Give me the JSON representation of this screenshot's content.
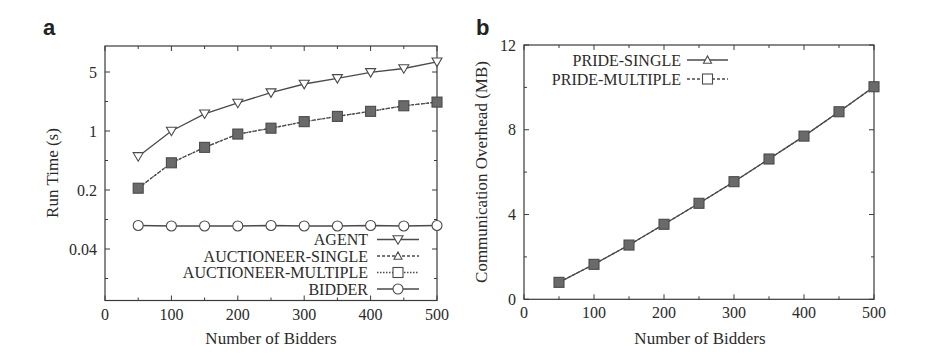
{
  "chart_data": [
    {
      "panel": "a",
      "type": "line",
      "title": "",
      "xlabel": "Number of Bidders",
      "ylabel": "Run Time (s)",
      "yscale": "log",
      "xlim": [
        0,
        500
      ],
      "ylim": [
        0.01,
        10
      ],
      "xticks": [
        0,
        100,
        200,
        300,
        400,
        500
      ],
      "xtick_labels": [
        "0",
        "100",
        "200",
        "300",
        "400",
        "500"
      ],
      "yticks": [
        5,
        1,
        0.2,
        0.04
      ],
      "ytick_labels": [
        "5",
        "1",
        "0.2",
        "0.04"
      ],
      "grid": false,
      "legend_position": "lower right",
      "x": [
        50,
        100,
        150,
        200,
        250,
        300,
        350,
        400,
        450,
        500
      ],
      "series": [
        {
          "name": "AGENT",
          "marker": "triangle-down",
          "line": "solid",
          "values": [
            0.5,
            1.0,
            1.6,
            2.15,
            2.85,
            3.6,
            4.2,
            4.95,
            5.5,
            6.6
          ]
        },
        {
          "name": "AUCTIONEER-SINGLE",
          "marker": "triangle-up",
          "line": "dashed",
          "values": [
            0.21,
            0.42,
            0.64,
            0.92,
            1.08,
            1.29,
            1.49,
            1.71,
            1.99,
            2.2
          ]
        },
        {
          "name": "AUCTIONEER-MULTIPLE",
          "marker": "square",
          "line": "dotted",
          "values": [
            0.21,
            0.42,
            0.64,
            0.92,
            1.08,
            1.29,
            1.49,
            1.71,
            1.99,
            2.2
          ]
        },
        {
          "name": "BIDDER",
          "marker": "circle",
          "line": "solid",
          "values": [
            0.076,
            0.075,
            0.075,
            0.075,
            0.076,
            0.075,
            0.075,
            0.076,
            0.075,
            0.076
          ]
        }
      ]
    },
    {
      "panel": "b",
      "type": "line",
      "title": "",
      "xlabel": "Number of Bidders",
      "ylabel": "Communication Overhead (MB)",
      "yscale": "linear",
      "xlim": [
        0,
        500
      ],
      "ylim": [
        0,
        12
      ],
      "xticks": [
        0,
        100,
        200,
        300,
        400,
        500
      ],
      "xtick_labels": [
        "0",
        "100",
        "200",
        "300",
        "400",
        "500"
      ],
      "yticks": [
        0,
        4,
        8,
        12
      ],
      "ytick_labels": [
        "0",
        "4",
        "8",
        "12"
      ],
      "grid": false,
      "legend_position": "upper left",
      "x": [
        50,
        100,
        150,
        200,
        250,
        300,
        350,
        400,
        450,
        500
      ],
      "series": [
        {
          "name": "PRIDE-SINGLE",
          "marker": "triangle-up",
          "line": "solid",
          "values": [
            0.8,
            1.65,
            2.56,
            3.54,
            4.53,
            5.55,
            6.62,
            7.7,
            8.85,
            10.03
          ]
        },
        {
          "name": "PRIDE-MULTIPLE",
          "marker": "square",
          "line": "dashed",
          "values": [
            0.8,
            1.65,
            2.56,
            3.54,
            4.53,
            5.55,
            6.62,
            7.7,
            8.85,
            10.03
          ]
        }
      ]
    }
  ],
  "panels": {
    "a": {
      "label": "a",
      "ylabel": "Run Time (s)",
      "xlabel": "Number of Bidders"
    },
    "b": {
      "label": "b",
      "ylabel": "Communication Overhead (MB)",
      "xlabel": "Number of Bidders"
    }
  },
  "colors": {
    "line": "#4a4a4a",
    "axis": "#3a3a3a",
    "marker_fill_overlap": "#6a6a6a",
    "text": "#2a2a2a"
  }
}
